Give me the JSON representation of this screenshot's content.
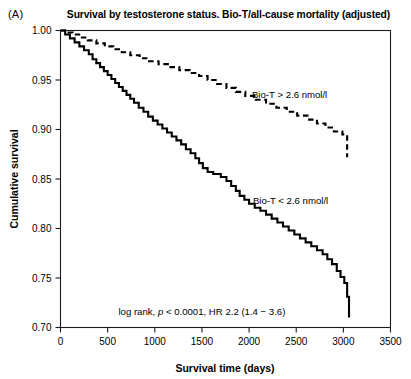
{
  "panel": {
    "label": "(A)"
  },
  "chart_data": {
    "type": "line",
    "title": "Survival by testosterone status. Bio-T/all-cause mortality (adjusted)",
    "xlabel": "Survival time (days)",
    "ylabel": "Cumulative survival",
    "xlim": [
      0,
      3500
    ],
    "ylim": [
      0.7,
      1.0
    ],
    "xticks": [
      0,
      500,
      1000,
      1500,
      2000,
      2500,
      3000,
      3500
    ],
    "xtick_labels": [
      "0",
      "500",
      "1000",
      "1500",
      "2000",
      "2500",
      "3000",
      "3500"
    ],
    "yticks": [
      0.7,
      0.75,
      0.8,
      0.85,
      0.9,
      0.95,
      1.0
    ],
    "ytick_labels": [
      "0.70",
      "0.75",
      "0.80",
      "0.85",
      "0.90",
      "0.95",
      "1.00"
    ],
    "grid": false,
    "legend_position": "inline-annotation",
    "annotations": [
      {
        "name": "log-rank-statistics",
        "text_prefix": "log rank, ",
        "text_italic": "p",
        "text_suffix": " < 0.0001, HR 2.2 (1.4 − 3.6)",
        "text_full": "log rank, p < 0.0001, HR 2.2 (1.4 − 3.6)",
        "x": 1500,
        "y": 0.713
      }
    ],
    "series": [
      {
        "name": "Bio-T > 2.6 nmol/l",
        "style": "dashed",
        "color": "#000000",
        "label_x": 2430,
        "label_y": 0.932,
        "points": [
          [
            0,
            1.0
          ],
          [
            60,
            1.0
          ],
          [
            60,
            0.998
          ],
          [
            130,
            0.998
          ],
          [
            130,
            0.996
          ],
          [
            210,
            0.996
          ],
          [
            210,
            0.993
          ],
          [
            290,
            0.993
          ],
          [
            290,
            0.99
          ],
          [
            380,
            0.99
          ],
          [
            380,
            0.987
          ],
          [
            470,
            0.987
          ],
          [
            470,
            0.984
          ],
          [
            560,
            0.984
          ],
          [
            560,
            0.981
          ],
          [
            650,
            0.981
          ],
          [
            650,
            0.978
          ],
          [
            740,
            0.978
          ],
          [
            740,
            0.975
          ],
          [
            840,
            0.975
          ],
          [
            840,
            0.972
          ],
          [
            940,
            0.972
          ],
          [
            940,
            0.969
          ],
          [
            1040,
            0.969
          ],
          [
            1040,
            0.966
          ],
          [
            1150,
            0.966
          ],
          [
            1150,
            0.963
          ],
          [
            1260,
            0.963
          ],
          [
            1260,
            0.96
          ],
          [
            1370,
            0.96
          ],
          [
            1370,
            0.957
          ],
          [
            1470,
            0.957
          ],
          [
            1470,
            0.954
          ],
          [
            1560,
            0.954
          ],
          [
            1560,
            0.95
          ],
          [
            1660,
            0.95
          ],
          [
            1660,
            0.946
          ],
          [
            1760,
            0.946
          ],
          [
            1760,
            0.942
          ],
          [
            1860,
            0.942
          ],
          [
            1860,
            0.938
          ],
          [
            1960,
            0.938
          ],
          [
            1960,
            0.934
          ],
          [
            2070,
            0.934
          ],
          [
            2070,
            0.93
          ],
          [
            2180,
            0.93
          ],
          [
            2180,
            0.926
          ],
          [
            2290,
            0.926
          ],
          [
            2290,
            0.922
          ],
          [
            2400,
            0.922
          ],
          [
            2400,
            0.918
          ],
          [
            2510,
            0.918
          ],
          [
            2510,
            0.914
          ],
          [
            2620,
            0.914
          ],
          [
            2620,
            0.91
          ],
          [
            2720,
            0.91
          ],
          [
            2720,
            0.906
          ],
          [
            2810,
            0.906
          ],
          [
            2810,
            0.902
          ],
          [
            2900,
            0.902
          ],
          [
            2900,
            0.898
          ],
          [
            2990,
            0.898
          ],
          [
            2990,
            0.895
          ],
          [
            3040,
            0.895
          ],
          [
            3040,
            0.872
          ]
        ]
      },
      {
        "name": "Bio-T < 2.6 nmol/l",
        "style": "solid",
        "color": "#000000",
        "label_x": 2440,
        "label_y": 0.825,
        "points": [
          [
            0,
            1.0
          ],
          [
            50,
            1.0
          ],
          [
            50,
            0.996
          ],
          [
            100,
            0.996
          ],
          [
            100,
            0.992
          ],
          [
            150,
            0.992
          ],
          [
            150,
            0.988
          ],
          [
            200,
            0.988
          ],
          [
            200,
            0.984
          ],
          [
            250,
            0.984
          ],
          [
            250,
            0.98
          ],
          [
            300,
            0.98
          ],
          [
            300,
            0.976
          ],
          [
            340,
            0.976
          ],
          [
            340,
            0.971
          ],
          [
            380,
            0.971
          ],
          [
            380,
            0.967
          ],
          [
            420,
            0.967
          ],
          [
            420,
            0.963
          ],
          [
            460,
            0.963
          ],
          [
            460,
            0.959
          ],
          [
            500,
            0.959
          ],
          [
            500,
            0.955
          ],
          [
            540,
            0.955
          ],
          [
            540,
            0.951
          ],
          [
            580,
            0.951
          ],
          [
            580,
            0.947
          ],
          [
            620,
            0.947
          ],
          [
            620,
            0.943
          ],
          [
            660,
            0.943
          ],
          [
            660,
            0.939
          ],
          [
            700,
            0.939
          ],
          [
            700,
            0.935
          ],
          [
            740,
            0.935
          ],
          [
            740,
            0.931
          ],
          [
            780,
            0.931
          ],
          [
            780,
            0.927
          ],
          [
            830,
            0.927
          ],
          [
            830,
            0.922
          ],
          [
            880,
            0.922
          ],
          [
            880,
            0.918
          ],
          [
            930,
            0.918
          ],
          [
            930,
            0.913
          ],
          [
            980,
            0.913
          ],
          [
            980,
            0.909
          ],
          [
            1030,
            0.909
          ],
          [
            1030,
            0.905
          ],
          [
            1080,
            0.905
          ],
          [
            1080,
            0.901
          ],
          [
            1130,
            0.901
          ],
          [
            1130,
            0.897
          ],
          [
            1180,
            0.897
          ],
          [
            1180,
            0.893
          ],
          [
            1230,
            0.893
          ],
          [
            1230,
            0.889
          ],
          [
            1280,
            0.889
          ],
          [
            1280,
            0.885
          ],
          [
            1330,
            0.885
          ],
          [
            1330,
            0.88
          ],
          [
            1380,
            0.88
          ],
          [
            1380,
            0.876
          ],
          [
            1430,
            0.876
          ],
          [
            1430,
            0.871
          ],
          [
            1470,
            0.871
          ],
          [
            1470,
            0.866
          ],
          [
            1510,
            0.866
          ],
          [
            1510,
            0.861
          ],
          [
            1560,
            0.861
          ],
          [
            1560,
            0.857
          ],
          [
            1620,
            0.857
          ],
          [
            1620,
            0.855
          ],
          [
            1700,
            0.855
          ],
          [
            1700,
            0.852
          ],
          [
            1760,
            0.852
          ],
          [
            1760,
            0.848
          ],
          [
            1810,
            0.848
          ],
          [
            1810,
            0.843
          ],
          [
            1860,
            0.843
          ],
          [
            1860,
            0.838
          ],
          [
            1900,
            0.838
          ],
          [
            1900,
            0.833
          ],
          [
            1950,
            0.833
          ],
          [
            1950,
            0.829
          ],
          [
            2000,
            0.829
          ],
          [
            2000,
            0.825
          ],
          [
            2060,
            0.825
          ],
          [
            2060,
            0.821
          ],
          [
            2120,
            0.821
          ],
          [
            2120,
            0.818
          ],
          [
            2180,
            0.818
          ],
          [
            2180,
            0.814
          ],
          [
            2240,
            0.814
          ],
          [
            2240,
            0.81
          ],
          [
            2300,
            0.81
          ],
          [
            2300,
            0.806
          ],
          [
            2360,
            0.806
          ],
          [
            2360,
            0.802
          ],
          [
            2420,
            0.802
          ],
          [
            2420,
            0.798
          ],
          [
            2480,
            0.798
          ],
          [
            2480,
            0.794
          ],
          [
            2540,
            0.794
          ],
          [
            2540,
            0.79
          ],
          [
            2600,
            0.79
          ],
          [
            2600,
            0.786
          ],
          [
            2660,
            0.786
          ],
          [
            2660,
            0.782
          ],
          [
            2720,
            0.782
          ],
          [
            2720,
            0.778
          ],
          [
            2780,
            0.778
          ],
          [
            2780,
            0.774
          ],
          [
            2830,
            0.774
          ],
          [
            2830,
            0.769
          ],
          [
            2880,
            0.769
          ],
          [
            2880,
            0.764
          ],
          [
            2930,
            0.764
          ],
          [
            2930,
            0.757
          ],
          [
            2970,
            0.757
          ],
          [
            2970,
            0.751
          ],
          [
            3010,
            0.751
          ],
          [
            3010,
            0.745
          ],
          [
            3040,
            0.745
          ],
          [
            3040,
            0.731
          ],
          [
            3060,
            0.731
          ],
          [
            3060,
            0.71
          ]
        ]
      }
    ]
  }
}
